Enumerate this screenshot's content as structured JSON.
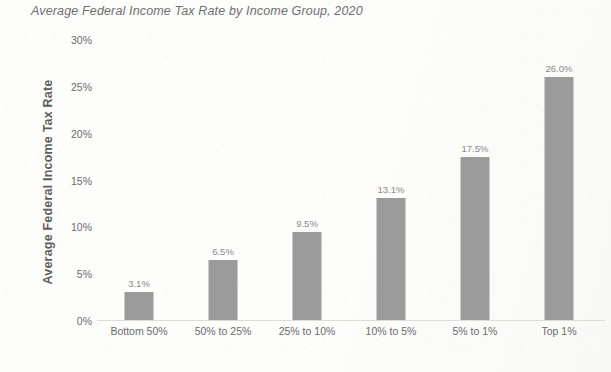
{
  "chart_data": {
    "type": "bar",
    "title": "Average Federal Income Tax Rate by Income Group, 2020",
    "xlabel": "",
    "ylabel": "Average Federal Income Tax Rate",
    "categories": [
      "Bottom 50%",
      "50% to 25%",
      "25% to 10%",
      "10% to 5%",
      "5% to 1%",
      "Top 1%"
    ],
    "values": [
      3.1,
      6.5,
      9.5,
      13.1,
      17.5,
      26.0
    ],
    "data_labels": [
      "3.1%",
      "6.5%",
      "9.5%",
      "13.1%",
      "17.5%",
      "26.0%"
    ],
    "ylim": [
      0,
      30
    ],
    "ytick_values": [
      0,
      5,
      10,
      15,
      20,
      25,
      30
    ],
    "ytick_labels": [
      "0%",
      "5%",
      "10%",
      "15%",
      "20%",
      "25%",
      "30%"
    ],
    "grid": false,
    "legend": "none",
    "bar_color": "#9b9b9b",
    "text_color": "#6b6b6b",
    "background_color": "#fdfdfc"
  }
}
